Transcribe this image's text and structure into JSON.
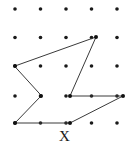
{
  "figure": {
    "label": "X",
    "caption_label": "X",
    "background_color": "#ffffff",
    "stroke_color": "#3a3a3a",
    "dot_color": "#1a1a1a",
    "grid": {
      "columns": 5,
      "rows": 5,
      "x_positions": [
        15,
        40.5,
        66,
        91.5,
        117
      ],
      "y_positions": [
        9,
        37.5,
        66,
        96,
        123
      ],
      "dot_radius": 1.8
    },
    "polygon": {
      "name": "non-convex-heptagon",
      "closed": true,
      "vertex_count": 7,
      "points": "15,66 96,37 70,96 123,96 70,123 15,123 41,96",
      "vertices": [
        {
          "x": 15,
          "y": 66
        },
        {
          "x": 96,
          "y": 37
        },
        {
          "x": 70,
          "y": 96
        },
        {
          "x": 123,
          "y": 96
        },
        {
          "x": 70,
          "y": 123
        },
        {
          "x": 15,
          "y": 123
        },
        {
          "x": 41,
          "y": 96
        }
      ]
    }
  }
}
